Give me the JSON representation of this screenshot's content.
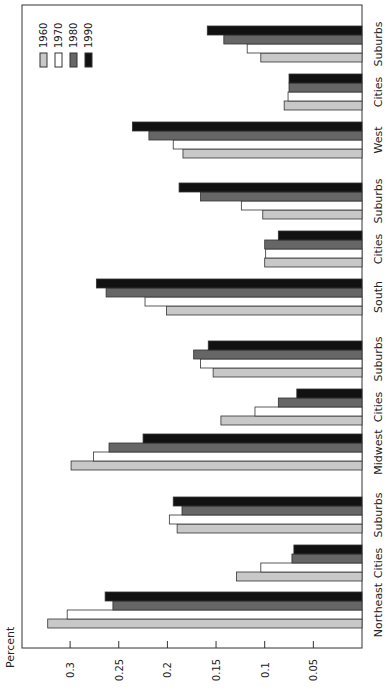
{
  "chart_data": {
    "type": "bar",
    "orientation": "rotated-90-clockwise",
    "title": "",
    "xlabel": "",
    "ylabel": "Percent",
    "ylim": [
      0,
      0.35
    ],
    "yticks": [
      0.05,
      0.1,
      0.15,
      0.2,
      0.25,
      0.3
    ],
    "ytick_labels": [
      "0.05",
      "0.1",
      "0.15",
      "0.2",
      "0.25",
      "0.3"
    ],
    "grid": false,
    "legend_position": "top-left",
    "categories": [
      "Northeast",
      "Cities",
      "Suburbs",
      "Midwest",
      "Cities",
      "Suburbs",
      "South",
      "Cities",
      "Suburbs",
      "West",
      "Cities",
      "Suburbs"
    ],
    "series": [
      {
        "name": "1960",
        "color": "#c8c8c8",
        "values": [
          0.323,
          0.129,
          0.19,
          0.299,
          0.145,
          0.153,
          0.201,
          0.1,
          0.102,
          0.184,
          0.08,
          0.104
        ]
      },
      {
        "name": "1970",
        "color": "#ffffff",
        "values": [
          0.303,
          0.104,
          0.198,
          0.276,
          0.11,
          0.166,
          0.223,
          0.099,
          0.124,
          0.194,
          0.076,
          0.118
        ]
      },
      {
        "name": "1980",
        "color": "#666666",
        "values": [
          0.256,
          0.072,
          0.185,
          0.26,
          0.086,
          0.173,
          0.263,
          0.1,
          0.166,
          0.219,
          0.075,
          0.142
        ]
      },
      {
        "name": "1990",
        "color": "#111111",
        "values": [
          0.264,
          0.07,
          0.194,
          0.225,
          0.067,
          0.158,
          0.273,
          0.086,
          0.188,
          0.236,
          0.075,
          0.159
        ]
      }
    ]
  }
}
